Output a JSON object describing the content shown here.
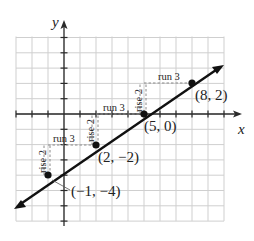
{
  "chart_data": {
    "type": "line",
    "title": "",
    "xlabel": "x",
    "ylabel": "y",
    "xlim": [
      -3,
      10
    ],
    "ylim": [
      -7,
      5
    ],
    "grid": true,
    "grid_step": 1,
    "line": {
      "slope": "2/3",
      "equation": "y = (2/3)x - 10/3"
    },
    "points": [
      {
        "x": -1,
        "y": -4,
        "label": "(−1, −4)"
      },
      {
        "x": 2,
        "y": -2,
        "label": "(2, −2)"
      },
      {
        "x": 5,
        "y": 0,
        "label": "(5, 0)"
      },
      {
        "x": 8,
        "y": 2,
        "label": "(8, 2)"
      }
    ],
    "annotations": [
      {
        "type": "rise",
        "text": "rise 2",
        "from": [
          -1,
          -4
        ],
        "to": [
          -1,
          -2
        ]
      },
      {
        "type": "run",
        "text": "run 3",
        "from": [
          -1,
          -2
        ],
        "to": [
          2,
          -2
        ]
      },
      {
        "type": "rise",
        "text": "rise 2",
        "from": [
          2,
          -2
        ],
        "to": [
          2,
          0
        ]
      },
      {
        "type": "run",
        "text": "run 3",
        "from": [
          2,
          0
        ],
        "to": [
          5,
          0
        ]
      },
      {
        "type": "rise",
        "text": "rise 2",
        "from": [
          5,
          0
        ],
        "to": [
          5,
          2
        ]
      },
      {
        "type": "run",
        "text": "run 3",
        "from": [
          5,
          2
        ],
        "to": [
          8,
          2
        ]
      }
    ]
  },
  "labels": {
    "x_axis": "x",
    "y_axis": "y",
    "p1": "(−1, −4)",
    "p2": "(2, −2)",
    "p3": "(5, 0)",
    "p4": "(8, 2)",
    "rise": "rise 2",
    "run": "run 3"
  },
  "colors": {
    "grid": "#c8c8c8",
    "axis": "#2a2a2a",
    "line": "#111111",
    "dash": "#9a9a9a"
  }
}
